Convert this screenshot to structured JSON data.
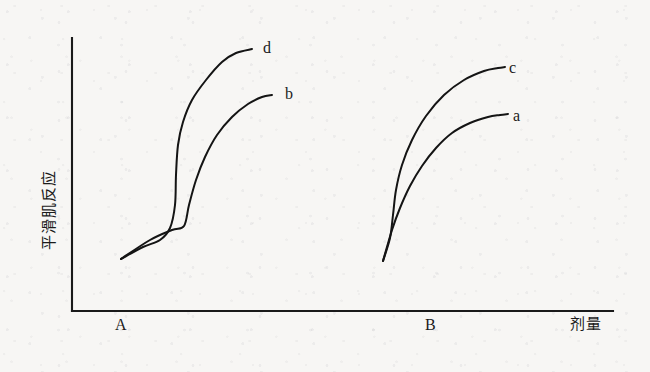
{
  "figure": {
    "background_color": "#f7f6f4",
    "ink_color": "#141414"
  },
  "axes": {
    "y_label": "平滑肌反应",
    "x_label": "剂量",
    "origin": {
      "x": 72,
      "y": 311
    },
    "y_axis_top": 38,
    "x_axis_right": 613
  },
  "groups": [
    {
      "id": "A",
      "label": "A"
    },
    {
      "id": "B",
      "label": "B"
    }
  ],
  "curve_labels": {
    "d": "d",
    "b": "b",
    "c": "c",
    "a": "a"
  },
  "chart_data": {
    "type": "line",
    "title": "",
    "xlabel": "剂量",
    "ylabel": "平滑肌反应",
    "grid": false,
    "legend_position": "inline-right-of-curve-end",
    "axis_style": "unlabeled-schematic",
    "xlim": [
      0,
      100
    ],
    "ylim": [
      0,
      100
    ],
    "group_markers": [
      "A",
      "B"
    ],
    "series": [
      {
        "name": "d",
        "group": "A",
        "label": "d",
        "description": "steep sigmoid, highest plateau in group A",
        "points": [
          [
            121,
            259
          ],
          [
            143,
            247
          ],
          [
            160,
            240
          ],
          [
            170,
            228
          ],
          [
            175,
            205
          ],
          [
            176,
            175
          ],
          [
            178,
            145
          ],
          [
            183,
            122
          ],
          [
            192,
            100
          ],
          [
            206,
            80
          ],
          [
            222,
            62
          ],
          [
            236,
            53
          ],
          [
            252,
            49
          ]
        ],
        "label_pos": [
          263,
          48
        ]
      },
      {
        "name": "b",
        "group": "A",
        "label": "b",
        "description": "sigmoid shifted right with a shoulder at low dose, lower plateau than d",
        "points": [
          [
            121,
            259
          ],
          [
            150,
            240
          ],
          [
            172,
            230
          ],
          [
            184,
            226
          ],
          [
            189,
            205
          ],
          [
            196,
            180
          ],
          [
            205,
            157
          ],
          [
            217,
            135
          ],
          [
            232,
            117
          ],
          [
            248,
            104
          ],
          [
            262,
            97
          ],
          [
            272,
            95
          ]
        ],
        "label_pos": [
          285,
          94
        ]
      },
      {
        "name": "c",
        "group": "B",
        "label": "c",
        "description": "steep hyperbolic rise, highest plateau in group B",
        "points": [
          [
            383,
            261
          ],
          [
            390,
            238
          ],
          [
            393,
            215
          ],
          [
            396,
            190
          ],
          [
            402,
            165
          ],
          [
            412,
            140
          ],
          [
            426,
            116
          ],
          [
            444,
            95
          ],
          [
            464,
            80
          ],
          [
            484,
            71
          ],
          [
            498,
            68
          ],
          [
            505,
            67
          ]
        ],
        "label_pos": [
          509,
          68
        ]
      },
      {
        "name": "a",
        "group": "B",
        "label": "a",
        "description": "shallower rise from same origin, lower plateau than c",
        "points": [
          [
            383,
            261
          ],
          [
            392,
            230
          ],
          [
            400,
            208
          ],
          [
            410,
            186
          ],
          [
            422,
            166
          ],
          [
            436,
            148
          ],
          [
            452,
            133
          ],
          [
            470,
            123
          ],
          [
            488,
            117
          ],
          [
            500,
            115
          ],
          [
            508,
            114
          ]
        ],
        "label_pos": [
          513,
          116
        ]
      }
    ]
  }
}
